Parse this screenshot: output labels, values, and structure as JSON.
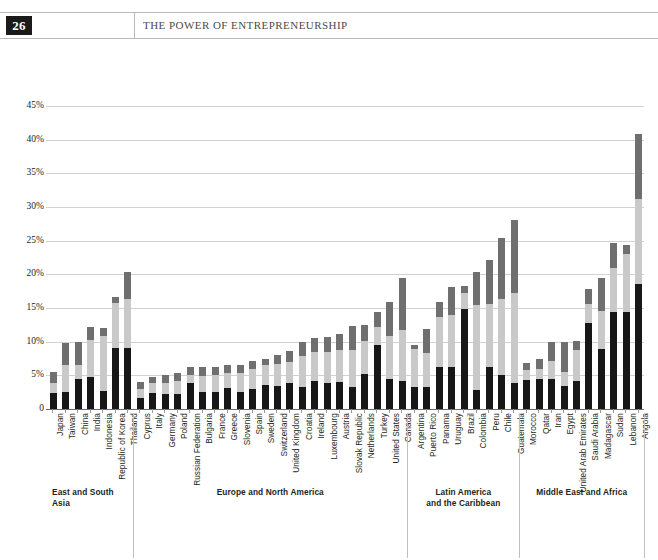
{
  "page": {
    "folio": "26",
    "running_head": "THE POWER OF ENTREPRENEURSHIP"
  },
  "legend": {
    "items": [
      {
        "label": "0 jobs in 5 years",
        "color": "#171717"
      },
      {
        "label": "1–5 jobs in 5 years",
        "color": "#c9c9c9"
      },
      {
        "label": "6 or more jobs in 5 years",
        "color": "#6f6f6f"
      }
    ]
  },
  "groups": [
    {
      "name": "East and South Asia",
      "start": 0,
      "end": 6,
      "align": "left"
    },
    {
      "name": "Europe and North America",
      "start": 7,
      "end": 28,
      "align": "center"
    },
    {
      "name": "Latin America\nand the Caribbean",
      "start": 29,
      "end": 37,
      "align": "center"
    },
    {
      "name": "Middle East and Africa",
      "start": 38,
      "end": 47,
      "align": "center"
    }
  ],
  "chart_data": {
    "type": "bar",
    "stacked": true,
    "title": "",
    "xlabel": "",
    "ylabel": "",
    "ylim": [
      0,
      45
    ],
    "ytick_labels": [
      "0",
      "5%",
      "10%",
      "15%",
      "20%",
      "25%",
      "30%",
      "35%",
      "40%",
      "45%"
    ],
    "ytick_values": [
      0,
      5,
      10,
      15,
      20,
      25,
      30,
      35,
      40,
      45
    ],
    "grid": true,
    "legend_position": "bottom",
    "series": [
      {
        "name": "0 jobs in 5 years",
        "color": "#171717"
      },
      {
        "name": "1–5 jobs in 5 years",
        "color": "#c9c9c9"
      },
      {
        "name": "6 or more jobs in 5 years",
        "color": "#6f6f6f"
      }
    ],
    "categories": [
      "Japan",
      "Taiwan",
      "China",
      "India",
      "Indonesia",
      "Republic of Korea",
      "Thailand",
      "Cyprus",
      "Italy",
      "Germany",
      "Poland",
      "Russian Federation",
      "Bulgaria",
      "France",
      "Greece",
      "Slovenia",
      "Spain",
      "Sweden",
      "Switzerland",
      "United Kingdom",
      "Croatia",
      "Ireland",
      "Luxembourg",
      "Austria",
      "Slovak Republic",
      "Netherlands",
      "Turkey",
      "United States",
      "Canada",
      "Argentina",
      "Puerto Rico",
      "Panama",
      "Uruguay",
      "Brazil",
      "Colombia",
      "Peru",
      "Chile",
      "Guatemala",
      "Morocco",
      "Qatar",
      "Iran",
      "Egypt",
      "United Arab Emirates",
      "Saudi Arabia",
      "Madagascar",
      "Sudan",
      "Lebanon",
      "Angola"
    ],
    "values": [
      [
        2.4,
        1.4,
        1.7
      ],
      [
        2.6,
        4.0,
        3.2
      ],
      [
        4.4,
        2.1,
        3.4
      ],
      [
        4.7,
        5.6,
        1.9
      ],
      [
        2.7,
        8.1,
        1.2
      ],
      [
        9.0,
        6.8,
        0.8
      ],
      [
        9.1,
        7.3,
        3.9
      ],
      [
        1.6,
        1.4,
        1.0
      ],
      [
        2.4,
        1.4,
        1.0
      ],
      [
        2.2,
        1.6,
        1.3
      ],
      [
        2.2,
        2.0,
        1.2
      ],
      [
        3.8,
        1.3,
        1.1
      ],
      [
        2.6,
        2.3,
        1.3
      ],
      [
        2.5,
        2.5,
        1.3
      ],
      [
        3.1,
        2.2,
        1.2
      ],
      [
        2.6,
        2.7,
        1.3
      ],
      [
        2.9,
        3.0,
        1.2
      ],
      [
        3.5,
        3.0,
        1.0
      ],
      [
        3.4,
        3.3,
        1.3
      ],
      [
        3.8,
        3.2,
        1.6
      ],
      [
        3.3,
        4.6,
        2.0
      ],
      [
        4.1,
        4.3,
        2.2
      ],
      [
        3.9,
        4.5,
        2.3
      ],
      [
        4.0,
        4.8,
        2.4
      ],
      [
        3.2,
        5.5,
        3.7
      ],
      [
        5.2,
        4.9,
        2.4
      ],
      [
        9.5,
        2.7,
        2.2
      ],
      [
        4.4,
        6.4,
        5.1
      ],
      [
        4.2,
        7.6,
        7.6
      ],
      [
        3.2,
        5.7,
        0.6
      ],
      [
        3.2,
        5.1,
        3.6
      ],
      [
        6.3,
        7.4,
        2.2
      ],
      [
        6.2,
        7.8,
        4.1
      ],
      [
        14.8,
        2.5,
        0.9
      ],
      [
        2.8,
        12.6,
        5.0
      ],
      [
        6.2,
        9.4,
        6.5
      ],
      [
        5.1,
        11.3,
        9.0
      ],
      [
        3.9,
        13.3,
        10.8
      ],
      [
        4.3,
        1.5,
        1.0
      ],
      [
        4.5,
        1.5,
        1.5
      ],
      [
        4.5,
        2.6,
        2.9
      ],
      [
        3.4,
        2.1,
        4.5
      ],
      [
        4.1,
        4.6,
        1.4
      ],
      [
        12.8,
        2.8,
        2.2
      ],
      [
        8.9,
        5.6,
        4.9
      ],
      [
        14.4,
        6.5,
        3.7
      ],
      [
        14.4,
        8.6,
        1.4
      ],
      [
        18.6,
        12.6,
        9.7
      ]
    ]
  }
}
